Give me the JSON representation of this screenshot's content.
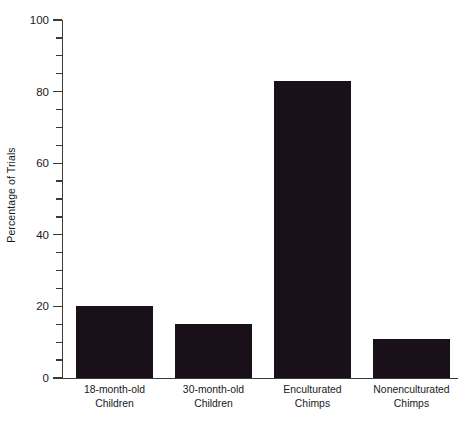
{
  "chart_data": {
    "type": "bar",
    "title": "",
    "xlabel": "",
    "ylabel": "Percentage of Trials",
    "categories": [
      "18-month-old Children",
      "30-month-old Children",
      "Enculturated Chimps",
      "Nonenculturated Chimps"
    ],
    "category_lines": [
      [
        "18-month-old",
        "Children"
      ],
      [
        "30-month-old",
        "Children"
      ],
      [
        "Enculturated",
        "Chimps"
      ],
      [
        "Nonenculturated",
        "Chimps"
      ]
    ],
    "values": [
      20,
      15,
      83,
      11
    ],
    "ylim": [
      0,
      100
    ],
    "y_major_ticks": [
      0,
      20,
      40,
      60,
      80,
      100
    ],
    "y_minor_tick_step": 5,
    "y_tick_labels": [
      "0",
      "20",
      "40",
      "60",
      "80",
      "100"
    ],
    "grid": false,
    "legend": false,
    "bar_color": "#19101a",
    "axis_color": "#3a3a3a",
    "background_color": "#ffffff"
  },
  "axis": {
    "y_title": "Percentage of Trials"
  }
}
